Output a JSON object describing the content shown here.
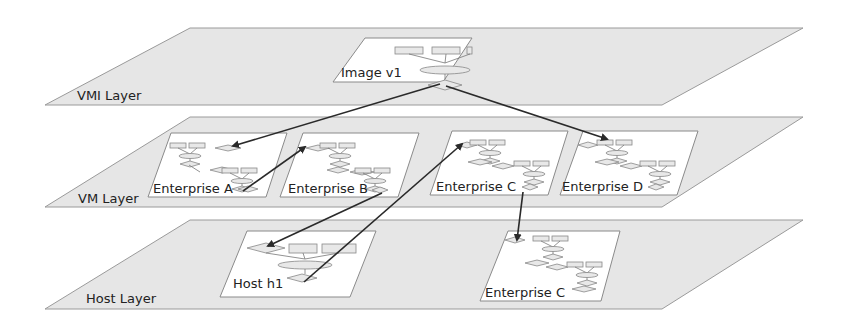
{
  "diagram": {
    "layers": [
      {
        "id": "vmi",
        "label": "VMI Layer"
      },
      {
        "id": "vm",
        "label": "VM Layer"
      },
      {
        "id": "host",
        "label": "Host Layer"
      }
    ],
    "cards": [
      {
        "id": "image-v1",
        "layer": "vmi",
        "label": "Image v1"
      },
      {
        "id": "enterprise-a",
        "layer": "vm",
        "label": "Enterprise A"
      },
      {
        "id": "enterprise-b",
        "layer": "vm",
        "label": "Enterprise B"
      },
      {
        "id": "enterprise-c-vm",
        "layer": "vm",
        "label": "Enterprise C"
      },
      {
        "id": "enterprise-d",
        "layer": "vm",
        "label": "Enterprise D"
      },
      {
        "id": "host-h1",
        "layer": "host",
        "label": "Host h1"
      },
      {
        "id": "enterprise-c-host",
        "layer": "host",
        "label": "Enterprise C"
      }
    ],
    "edges": [
      {
        "from": "image-v1",
        "to": "enterprise-a"
      },
      {
        "from": "image-v1",
        "to": "enterprise-d"
      },
      {
        "from": "enterprise-a",
        "to": "enterprise-b"
      },
      {
        "from": "enterprise-b",
        "to": "host-h1"
      },
      {
        "from": "host-h1",
        "to": "enterprise-c-vm"
      },
      {
        "from": "enterprise-c-vm",
        "to": "enterprise-c-host"
      }
    ],
    "colors": {
      "layer_fill": "#e6e6e6",
      "card_fill": "#ffffff",
      "arrow": "#2a2a2a"
    }
  }
}
